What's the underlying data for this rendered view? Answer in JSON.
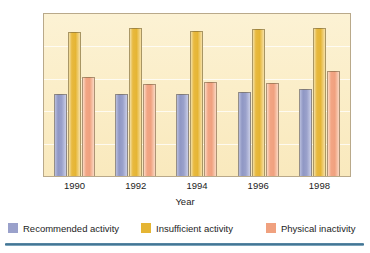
{
  "chart_data": {
    "type": "bar",
    "title": "",
    "subtitle": "",
    "xlabel": "Year",
    "ylabel": "Participation (%)",
    "categories": [
      "1990",
      "1992",
      "1994",
      "1996",
      "1998"
    ],
    "series": [
      {
        "name": "Recommended activity",
        "color": "#9aa1cb",
        "values": [
          25.4,
          25.4,
          25.3,
          25.9,
          26.8
        ]
      },
      {
        "name": "Insufficient activity",
        "color": "#e5b534",
        "values": [
          44.5,
          45.6,
          44.8,
          45.5,
          45.6
        ]
      },
      {
        "name": "Physical inactivity",
        "color": "#f0a17f",
        "values": [
          30.7,
          28.5,
          29.1,
          28.8,
          32.4
        ]
      }
    ],
    "ylim": [
      0,
      50
    ],
    "yticks": [
      0,
      10,
      20,
      30,
      40,
      50
    ],
    "ytick_labels": [
      "0",
      "10",
      "20",
      "30",
      "40",
      "50"
    ],
    "grid": true,
    "grid_axis": "y",
    "legend_position": "bottom",
    "plot_background": "#fbeec9",
    "frame_color": "#b9a98a"
  },
  "axes": {
    "y_title": "Participation (%)",
    "x_title": "Year"
  },
  "legend": {
    "items": [
      {
        "label": "Recommended activity",
        "color": "#9aa1cb"
      },
      {
        "label": "Insufficient activity",
        "color": "#e5b534"
      },
      {
        "label": "Physical inactivity",
        "color": "#f0a17f"
      }
    ]
  },
  "decor": {
    "rule_color": "#417392"
  }
}
